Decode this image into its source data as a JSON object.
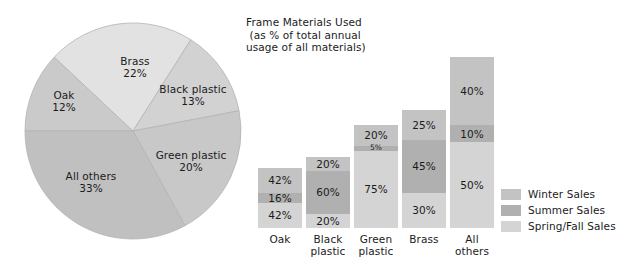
{
  "title": {
    "lines": "Frame Materials Used\n (as % of total annual\nusage of all materials)"
  },
  "chart_data": [
    {
      "type": "pie",
      "title": "Frame Materials Used (as % of total annual usage of all materials)",
      "categories": [
        "Oak",
        "Brass",
        "Black plastic",
        "Green plastic",
        "All others"
      ],
      "values": [
        12,
        22,
        13,
        20,
        33
      ],
      "unit": "%",
      "start_angle_deg": 180,
      "direction": "clockwise",
      "slices": [
        {
          "label": "Oak",
          "value": 12,
          "value_text": "12%",
          "color": "#cacaca"
        },
        {
          "label": "Brass",
          "value": 22,
          "value_text": "22%",
          "color": "#e2e2e2"
        },
        {
          "label": "Black plastic",
          "value": 13,
          "value_text": "13%",
          "color": "#d2d2d2"
        },
        {
          "label": "Green plastic",
          "value": 20,
          "value_text": "20%",
          "color": "#c8c8c8"
        },
        {
          "label": "All others",
          "value": 33,
          "value_text": "33%",
          "color": "#c0c0c0"
        }
      ]
    },
    {
      "type": "bar",
      "subtype": "stacked",
      "title": "Frame Materials Used (as % of total annual usage of all materials)",
      "xlabel": "",
      "ylabel": "",
      "ylim": [
        0,
        100
      ],
      "grid": false,
      "legend_position": "right",
      "categories": [
        "Oak",
        "Black plastic",
        "Green plastic",
        "Brass",
        "All others"
      ],
      "series": [
        {
          "name": "Winter Sales",
          "color": "#c3c3c3",
          "values": [
            42,
            20,
            20,
            25,
            40
          ]
        },
        {
          "name": "Summer Sales",
          "color": "#b0b0b0",
          "values": [
            16,
            60,
            5,
            45,
            10
          ]
        },
        {
          "name": "Spring/Fall Sales",
          "color": "#d4d4d4",
          "values": [
            42,
            20,
            75,
            30,
            50
          ]
        }
      ],
      "column_total_heights_px": [
        60,
        71,
        103,
        118,
        171
      ]
    }
  ],
  "pie": {
    "labels": [
      {
        "name": "Brass",
        "value": "22%"
      },
      {
        "name": "Black plastic",
        "value": "13%"
      },
      {
        "name": "Oak",
        "value": "12%"
      },
      {
        "name": "Green plastic",
        "value": "20%"
      },
      {
        "name": "All others",
        "value": "33%"
      }
    ]
  },
  "bars": {
    "columns": [
      {
        "category": "Oak",
        "category_line1": "Oak",
        "category_line2": "",
        "height_px": 60,
        "segments": [
          {
            "series": "Winter Sales",
            "value": 42,
            "label": "42%",
            "tone": "winter"
          },
          {
            "series": "Summer Sales",
            "value": 16,
            "label": "16%",
            "tone": "summer"
          },
          {
            "series": "Spring/Fall Sales",
            "value": 42,
            "label": "42%",
            "tone": "spring"
          }
        ]
      },
      {
        "category": "Black plastic",
        "category_line1": "Black",
        "category_line2": "plastic",
        "height_px": 71,
        "segments": [
          {
            "series": "Winter Sales",
            "value": 20,
            "label": "20%",
            "tone": "winter"
          },
          {
            "series": "Summer Sales",
            "value": 60,
            "label": "60%",
            "tone": "summer"
          },
          {
            "series": "Spring/Fall Sales",
            "value": 20,
            "label": "20%",
            "tone": "spring"
          }
        ]
      },
      {
        "category": "Green plastic",
        "category_line1": "Green",
        "category_line2": "plastic",
        "height_px": 103,
        "segments": [
          {
            "series": "Winter Sales",
            "value": 20,
            "label": "20%",
            "tone": "winter"
          },
          {
            "series": "Summer Sales",
            "value": 5,
            "label": "5%",
            "tone": "summer",
            "tiny": true
          },
          {
            "series": "Spring/Fall Sales",
            "value": 75,
            "label": "75%",
            "tone": "spring"
          }
        ]
      },
      {
        "category": "Brass",
        "category_line1": "Brass",
        "category_line2": "",
        "height_px": 118,
        "segments": [
          {
            "series": "Winter Sales",
            "value": 25,
            "label": "25%",
            "tone": "winter"
          },
          {
            "series": "Summer Sales",
            "value": 45,
            "label": "45%",
            "tone": "summer"
          },
          {
            "series": "Spring/Fall Sales",
            "value": 30,
            "label": "30%",
            "tone": "spring"
          }
        ]
      },
      {
        "category": "All others",
        "category_line1": "All",
        "category_line2": "others",
        "height_px": 171,
        "segments": [
          {
            "series": "Winter Sales",
            "value": 40,
            "label": "40%",
            "tone": "winter"
          },
          {
            "series": "Summer Sales",
            "value": 10,
            "label": "10%",
            "tone": "summer"
          },
          {
            "series": "Spring/Fall Sales",
            "value": 50,
            "label": "50%",
            "tone": "spring"
          }
        ]
      }
    ]
  },
  "legend": {
    "items": [
      {
        "label": "Winter Sales",
        "tone": "winter",
        "color": "#c3c3c3"
      },
      {
        "label": "Summer Sales",
        "tone": "summer",
        "color": "#b0b0b0"
      },
      {
        "label": "Spring/Fall Sales",
        "tone": "spring",
        "color": "#d4d4d4"
      }
    ]
  }
}
